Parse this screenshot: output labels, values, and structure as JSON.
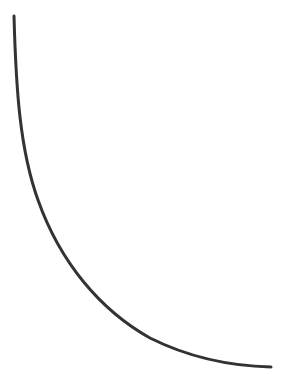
{
  "diagram": {
    "type": "curve",
    "stroke_color": "#333333",
    "stroke_width": 3,
    "background": "#ffffff",
    "path": "M14,16 C16,90 20,150 38,200 C60,262 100,310 150,338 C190,358 230,366 271,367"
  }
}
